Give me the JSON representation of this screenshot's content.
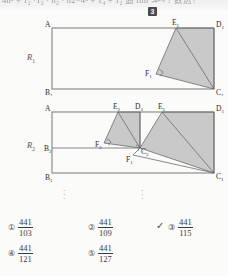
{
  "top_text": {
    "fragment": "4n² + 1₂ ·1₂ · n₂ · n2−4ⁿ + 1₄ + 1₂  追 lim ≫ᵒᵍ  ? 数込？",
    "limit": "n→∞"
  },
  "badge": {
    "number": "3"
  },
  "figure1": {
    "name": "R1",
    "region_label": "R",
    "region_sub": "1",
    "vertices": {
      "A": {
        "label": "A",
        "sub": "",
        "x": 52,
        "y": 12
      },
      "D1": {
        "label": "D",
        "sub": "1",
        "x": 214,
        "y": 12
      },
      "B1": {
        "label": "B",
        "sub": "1",
        "x": 52,
        "y": 73
      },
      "C1": {
        "label": "C",
        "sub": "1",
        "x": 214,
        "y": 73
      },
      "E1": {
        "label": "E",
        "sub": "1",
        "x": 176,
        "y": 12
      },
      "F1": {
        "label": "F",
        "sub": "1",
        "x": 156,
        "y": 58
      }
    },
    "shaded_polygon": "E1,D1,C1,F1",
    "inner_segment": "E1-C1",
    "right_angle_at": "F1"
  },
  "figure2": {
    "name": "R2",
    "region_label": "R",
    "region_sub": "2",
    "vertices": {
      "A": {
        "label": "A",
        "sub": "",
        "x": 52,
        "y": 12
      },
      "D1": {
        "label": "D",
        "sub": "1",
        "x": 214,
        "y": 12
      },
      "B1": {
        "label": "B",
        "sub": "1",
        "x": 52,
        "y": 73
      },
      "C1": {
        "label": "C",
        "sub": "1",
        "x": 214,
        "y": 73
      },
      "E1": {
        "label": "E",
        "sub": "1",
        "x": 162,
        "y": 12
      },
      "D2": {
        "label": "D",
        "sub": "2",
        "x": 140,
        "y": 12
      },
      "E2": {
        "label": "E",
        "sub": "2",
        "x": 118,
        "y": 12
      },
      "B2": {
        "label": "B",
        "sub": "2",
        "x": 52,
        "y": 48
      },
      "C2": {
        "label": "C",
        "sub": "2",
        "x": 140,
        "y": 48
      },
      "F1": {
        "label": "F",
        "sub": "1",
        "x": 133,
        "y": 55
      },
      "F2": {
        "label": "F",
        "sub": "2",
        "x": 104,
        "y": 43
      }
    },
    "shaded_polygons": [
      "E2,D2,C2,F2",
      "E1,D1,C1,C2"
    ],
    "right_angle_at": [
      "F2",
      "C2"
    ]
  },
  "ellipses": [
    {
      "x": 62,
      "y": 186
    },
    {
      "x": 140,
      "y": 186
    }
  ],
  "choices": [
    {
      "marker": "①",
      "numerator": "441",
      "denominator": "103",
      "selected": false
    },
    {
      "marker": "②",
      "numerator": "441",
      "denominator": "109",
      "selected": false
    },
    {
      "marker": "③",
      "numerator": "441",
      "denominator": "115",
      "selected": true
    },
    {
      "marker": "④",
      "numerator": "441",
      "denominator": "121",
      "selected": false
    },
    {
      "marker": "⑤",
      "numerator": "441",
      "denominator": "127",
      "selected": false
    }
  ],
  "check_glyph": "✓",
  "colors": {
    "page_bg": "#fbfbfa",
    "stroke": "#6b6b6b",
    "shade": "#c9c9c9",
    "text": "#2e2e2e",
    "badge_bg": "#4a4a4a"
  }
}
